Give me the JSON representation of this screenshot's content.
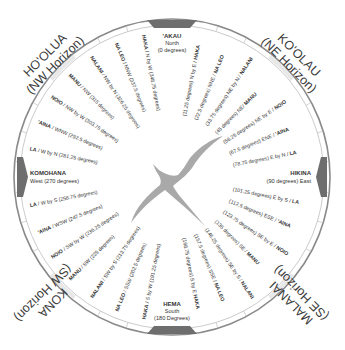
{
  "colors": {
    "ring": "#8a8a8a",
    "marker": "#6e6e6e",
    "bird": "#a9a9a9",
    "text": "#333333",
    "ring_highlight": "#c9c9c9"
  },
  "horizons": [
    {
      "id": "nw",
      "name": "HO'OLUA",
      "sub": "(NW Horizon)"
    },
    {
      "id": "ne",
      "name": "KO'OLAU",
      "sub": "(NE Horizon)"
    },
    {
      "id": "se",
      "name": "MALANAI",
      "sub": "(SE Horizon)"
    },
    {
      "id": "sw",
      "name": "KONA",
      "sub": "(SW Horizon)"
    }
  ],
  "cardinals": [
    {
      "id": "north",
      "name": "'AKAU",
      "line2": "North",
      "line3": "(0 degrees)"
    },
    {
      "id": "east",
      "name": "HIKINA",
      "line2": "(90 degrees) East"
    },
    {
      "id": "south",
      "name": "HEMA",
      "line2": "South",
      "line3": "(180 Degrees)"
    },
    {
      "id": "west",
      "name": "KOMOHANA",
      "line2": "West (270 degrees)"
    }
  ],
  "houses": [
    {
      "deg": 11.25,
      "text": "(11.25 degrees) N by E / ",
      "bold": "HAKA"
    },
    {
      "deg": 22.5,
      "text": "(22.5 degrees) NNE / ",
      "bold": "NA LEO"
    },
    {
      "deg": 33.75,
      "text": "(33.75 degrees) NE by N / ",
      "bold": "NALANI"
    },
    {
      "deg": 45,
      "text": "(45 degrees) NE/ ",
      "bold": "MANU"
    },
    {
      "deg": 56.25,
      "text": "(56.25 degrees) NE by E / ",
      "bold": "NOIO"
    },
    {
      "deg": 67.5,
      "text": "(67.5 degrees) ENE / ",
      "bold": "'AINA"
    },
    {
      "deg": 78.75,
      "text": "(78.75 degrees) E by N / ",
      "bold": "LA"
    },
    {
      "deg": 101.25,
      "text": "(101.25 degrees) E by S / ",
      "bold": "LA"
    },
    {
      "deg": 112.5,
      "text": "(112.5 degrees) ESE / ",
      "bold": "'AINA"
    },
    {
      "deg": 123.75,
      "text": "(123.75 degrees) SE by E / ",
      "bold": "NOIO"
    },
    {
      "deg": 135,
      "text": "(135 degrees) SE / ",
      "bold": "MANU"
    },
    {
      "deg": 146.25,
      "text": "(146.25 degrees) SE by S / ",
      "bold": "NALANI"
    },
    {
      "deg": 157.5,
      "text": "(157.5 degrees) SSE / ",
      "bold": "NA LEO"
    },
    {
      "deg": 168.75,
      "text": "(168.75 degrees) S by E ",
      "bold": "HAKA"
    },
    {
      "deg": 191.25,
      "bold": "HAKA",
      "text": " / S by W (191.25 degrees)"
    },
    {
      "deg": 202.5,
      "bold": "NA LEO",
      "text": " / SSW (202.5 degrees)"
    },
    {
      "deg": 213.75,
      "bold": "NALANI",
      "text": " / SW by S (213.75 degrees)"
    },
    {
      "deg": 225,
      "bold": "MANU",
      "text": " / SW (225 degrees)"
    },
    {
      "deg": 236.25,
      "bold": "NOIO",
      "text": " / SW by W (236.25 degrees)"
    },
    {
      "deg": 247.5,
      "bold": "'AINA",
      "text": " / WSW (247.5 degrees)"
    },
    {
      "deg": 258.75,
      "bold": "LA",
      "text": " / W by S (258.75 degrees)"
    },
    {
      "deg": 281.25,
      "bold": "LA",
      "text": " / W by N (281.25 degrees)"
    },
    {
      "deg": 292.5,
      "bold": "'AINA",
      "text": " / WNW (292.5 degrees)"
    },
    {
      "deg": 303.75,
      "bold": "NOIO",
      "text": " / NW by W (303.75 degrees)"
    },
    {
      "deg": 315,
      "bold": "MANU",
      "text": " / NW (315 degrees)"
    },
    {
      "deg": 326.25,
      "bold": "NALANI",
      "text": " / NW by N (326.25 degrees)"
    },
    {
      "deg": 337.5,
      "bold": "NA LEO",
      "text": " / NNW (337.5 degrees)"
    },
    {
      "deg": 348.75,
      "bold": "HAKA",
      "text": " / N by W (348.75 degrees)"
    }
  ]
}
